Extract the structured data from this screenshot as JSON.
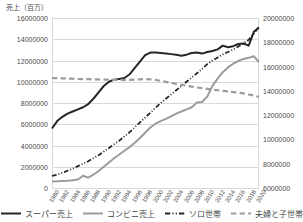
{
  "chart_data": {
    "type": "line",
    "title": "",
    "ylabel": "売上（百万）",
    "xlabel": "",
    "grid": true,
    "legend_position": "bottom",
    "x": [
      1980,
      1981,
      1982,
      1983,
      1984,
      1985,
      1986,
      1987,
      1988,
      1989,
      1990,
      1991,
      1992,
      1993,
      1994,
      1995,
      1996,
      1997,
      1998,
      1999,
      2000,
      2001,
      2002,
      2003,
      2004,
      2005,
      2006,
      2007,
      2008,
      2009,
      2010,
      2011,
      2012,
      2013,
      2014,
      2015,
      2016,
      2017,
      2018,
      2019,
      2020
    ],
    "xtick_labels": [
      "1980",
      "1982",
      "1984",
      "1986",
      "1988",
      "1990",
      "1992",
      "1994",
      "1996",
      "1998",
      "2000",
      "2002",
      "2004",
      "2006",
      "2008",
      "2010",
      "2012",
      "2014",
      "2016",
      "2018",
      "2020"
    ],
    "axes": [
      {
        "id": "left",
        "position": "left",
        "ylim": [
          0,
          16000000
        ],
        "ytick_labels": [
          "16000000",
          "14000000",
          "12000000",
          "10000000",
          "8000000",
          "6000000",
          "4000000",
          "2000000",
          "0"
        ],
        "ytick_values": [
          16000000,
          14000000,
          12000000,
          10000000,
          8000000,
          6000000,
          4000000,
          2000000,
          0
        ]
      },
      {
        "id": "right",
        "position": "right",
        "ylim": [
          6000000,
          20000000
        ],
        "ytick_labels": [
          "20000000",
          "18000000",
          "16000000",
          "14000000",
          "12000000",
          "10000000",
          "8000000",
          "6000000"
        ],
        "ytick_values": [
          20000000,
          18000000,
          16000000,
          14000000,
          12000000,
          10000000,
          8000000,
          6000000
        ]
      }
    ],
    "series": [
      {
        "name": "スーパー売上",
        "axis": "left",
        "color": "#262626",
        "style": "solid",
        "width": 2.0,
        "values": [
          5600000,
          6300000,
          6700000,
          7000000,
          7200000,
          7400000,
          7600000,
          7900000,
          8400000,
          9000000,
          9600000,
          10000000,
          10200000,
          10250000,
          10350000,
          10700000,
          11300000,
          11900000,
          12500000,
          12750000,
          12750000,
          12700000,
          12650000,
          12600000,
          12550000,
          12450000,
          12550000,
          12700000,
          12750000,
          12650000,
          12800000,
          12900000,
          13050000,
          13400000,
          13250000,
          13350000,
          13550000,
          13600000,
          13400000,
          14700000,
          15100000
        ]
      },
      {
        "name": "コンビニ売上",
        "axis": "left",
        "color": "#9b9b9b",
        "style": "solid",
        "width": 2.0,
        "values": [
          620000,
          630000,
          650000,
          680000,
          720000,
          800000,
          1150000,
          980000,
          1250000,
          1600000,
          2000000,
          2400000,
          2800000,
          3150000,
          3500000,
          3850000,
          4250000,
          4700000,
          5200000,
          5700000,
          6050000,
          6300000,
          6500000,
          6750000,
          7000000,
          7200000,
          7400000,
          7600000,
          8050000,
          8100000,
          8600000,
          9600000,
          10300000,
          10900000,
          11350000,
          11700000,
          11950000,
          12150000,
          12250000,
          12400000,
          11850000
        ]
      },
      {
        "name": "ソロ世帯",
        "axis": "right",
        "color": "#262626",
        "style": "dashdot",
        "width": 1.8,
        "values": [
          7000000,
          7100000,
          7250000,
          7420000,
          7600000,
          7800000,
          8000000,
          8200000,
          8450000,
          8700000,
          9000000,
          9300000,
          9600000,
          9900000,
          10250000,
          10600000,
          11000000,
          11400000,
          11800000,
          12200000,
          12600000,
          13000000,
          13350000,
          13700000,
          14050000,
          14400000,
          14750000,
          15100000,
          15450000,
          15800000,
          16200000,
          16500000,
          16750000,
          17000000,
          17200000,
          17400000,
          17650000,
          17900000,
          18200000,
          18700000,
          19300000
        ]
      },
      {
        "name": "夫婦と子世帯",
        "axis": "right",
        "color": "#9b9b9b",
        "style": "dashed",
        "width": 2.2,
        "values": [
          15050000,
          15050000,
          15030000,
          15010000,
          15000000,
          14980000,
          14970000,
          14960000,
          14950000,
          14940000,
          14930000,
          14920000,
          14910000,
          14900000,
          14890000,
          14900000,
          14920000,
          14950000,
          14980000,
          14950000,
          14900000,
          14820000,
          14740000,
          14660000,
          14580000,
          14500000,
          14420000,
          14350000,
          14280000,
          14220000,
          14160000,
          14100000,
          14050000,
          14000000,
          13950000,
          13900000,
          13850000,
          13790000,
          13700000,
          13620000,
          13500000
        ]
      }
    ]
  },
  "legend": {
    "items": [
      {
        "label": "スーパー売上"
      },
      {
        "label": "コンビニ売上"
      },
      {
        "label": "ソロ世帯"
      },
      {
        "label": "夫婦と子世帯"
      }
    ]
  }
}
